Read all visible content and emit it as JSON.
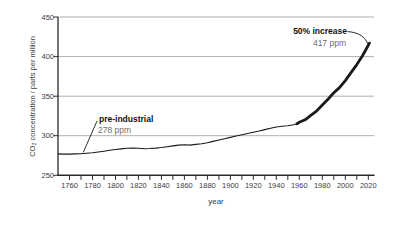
{
  "chart_data": {
    "type": "line",
    "title": "",
    "xlabel": "year",
    "ylabel": {
      "co": "CO",
      "sub": "2",
      "rest": " concentration / parts per million"
    },
    "ylabel_plain": "CO2 concentration / parts per million",
    "xlim": [
      1750,
      2025
    ],
    "ylim": [
      250,
      450
    ],
    "grid": "horizontal",
    "legend": "none",
    "yticks": [
      450,
      400,
      350,
      300,
      250
    ],
    "ytick_labels": [
      "450",
      "400",
      "350",
      "300",
      "250"
    ],
    "xtick_labels": [
      "1760",
      "1780",
      "1800",
      "1820",
      "1840",
      "1860",
      "1880",
      "1900",
      "1920",
      "1940",
      "1960",
      "1980",
      "2000",
      "2020"
    ],
    "xticks_minor": {
      "start": 1760,
      "end": 2020,
      "step": 10
    },
    "thick_from_year": 1958,
    "series": [
      {
        "name": "atmospheric CO2 concentration",
        "points": [
          [
            1750,
            277
          ],
          [
            1755,
            276.8
          ],
          [
            1760,
            276.8
          ],
          [
            1765,
            277
          ],
          [
            1770,
            277.3
          ],
          [
            1775,
            277.9
          ],
          [
            1780,
            278.6
          ],
          [
            1785,
            279.5
          ],
          [
            1790,
            280.5
          ],
          [
            1795,
            281.6
          ],
          [
            1800,
            282.6
          ],
          [
            1805,
            283.4
          ],
          [
            1810,
            284.1
          ],
          [
            1815,
            284.5
          ],
          [
            1820,
            284.2
          ],
          [
            1825,
            283.6
          ],
          [
            1830,
            283.8
          ],
          [
            1835,
            284.4
          ],
          [
            1840,
            285.1
          ],
          [
            1845,
            286.1
          ],
          [
            1850,
            287.1
          ],
          [
            1855,
            288.1
          ],
          [
            1860,
            288.6
          ],
          [
            1865,
            288.2
          ],
          [
            1870,
            289
          ],
          [
            1875,
            289.8
          ],
          [
            1880,
            291.2
          ],
          [
            1885,
            292.8
          ],
          [
            1890,
            294.6
          ],
          [
            1895,
            296.2
          ],
          [
            1900,
            297.9
          ],
          [
            1905,
            299.6
          ],
          [
            1910,
            301.2
          ],
          [
            1915,
            302.8
          ],
          [
            1920,
            304.4
          ],
          [
            1925,
            306
          ],
          [
            1930,
            307.7
          ],
          [
            1935,
            309.4
          ],
          [
            1940,
            311
          ],
          [
            1945,
            312
          ],
          [
            1950,
            312.7
          ],
          [
            1955,
            313.9
          ],
          [
            1958,
            315.2
          ],
          [
            1960,
            316.9
          ],
          [
            1965,
            320.1
          ],
          [
            1970,
            325.7
          ],
          [
            1975,
            331.1
          ],
          [
            1980,
            338.8
          ],
          [
            1985,
            346.1
          ],
          [
            1990,
            354.2
          ],
          [
            1995,
            360.8
          ],
          [
            2000,
            369.6
          ],
          [
            2005,
            379.8
          ],
          [
            2010,
            389.9
          ],
          [
            2015,
            401
          ],
          [
            2020,
            414.2
          ],
          [
            2021,
            417
          ]
        ]
      }
    ],
    "annotations": [
      {
        "label": "pre-industrial",
        "value": "278 ppm",
        "anchor_year": 1772,
        "anchor_ppm": 278
      },
      {
        "label": "50% increase",
        "value": "417 ppm",
        "anchor_year": 2021,
        "anchor_ppm": 417
      }
    ],
    "colors": {
      "line": "#1a1a1a",
      "grid": "#9a9a9a",
      "axis": "#2a2a2a",
      "tick_text": "#3d3d3d",
      "annotation_text": "#121212",
      "annotation_value": "#6f6f6f",
      "background": "#ffffff"
    }
  }
}
